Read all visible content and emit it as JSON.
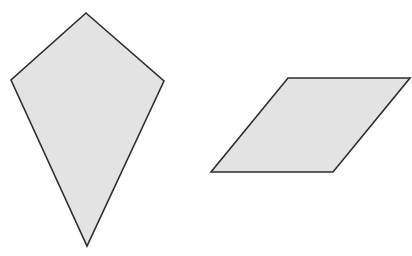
{
  "canvas": {
    "width": 412,
    "height": 256,
    "background": "#ffffff"
  },
  "style": {
    "fill": "#e3e3e3",
    "stroke": "#2e2e2e",
    "stroke_width": 1.6
  },
  "shapes": [
    {
      "name": "kite",
      "points": "86,13 164,81 87,246 11,80"
    },
    {
      "name": "parallelogram",
      "points": "288,78 410,78 333,172 211,172"
    }
  ]
}
